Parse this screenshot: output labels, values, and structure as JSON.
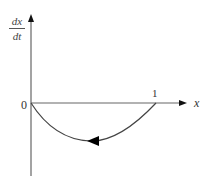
{
  "diagram": {
    "type": "phase-line-plot",
    "y_axis_label": {
      "numerator": "dx",
      "denominator": "dt"
    },
    "x_axis_label": "x",
    "origin_label": "0",
    "tick_labels": [
      {
        "value": "1",
        "position": "x-axis"
      }
    ],
    "curve": {
      "description": "dx/dt vs x: negative arc from x=0 to x=1, zero at both endpoints",
      "direction": "leftward arrow along curve",
      "points": [
        [
          0,
          0
        ],
        [
          0.25,
          -0.75
        ],
        [
          0.5,
          -1.0
        ],
        [
          0.75,
          -0.75
        ],
        [
          1,
          0
        ]
      ]
    },
    "colors": {
      "axis": "#555555",
      "curve": "#444444",
      "arrow": "#000000",
      "background": "#ffffff"
    }
  }
}
